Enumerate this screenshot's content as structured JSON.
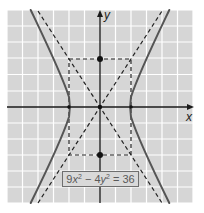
{
  "figure": {
    "type": "hyperbola-graph",
    "equation": {
      "coef_x": "9",
      "var_x": "x",
      "exp_x": "2",
      "minus": " − 4",
      "var_y": "y",
      "exp_y": "2",
      "rhs": " = 36",
      "full_text": "9x² − 4y² = 36"
    },
    "axes": {
      "x_label": "x",
      "y_label": "y"
    },
    "grid": {
      "x_range": [
        -6,
        6
      ],
      "y_range": [
        -6,
        6
      ],
      "step": 1
    },
    "key_points": {
      "vertices": [
        [
          -2,
          0
        ],
        [
          2,
          0
        ]
      ],
      "co_vertices": [
        [
          0,
          3
        ],
        [
          0,
          -3
        ]
      ],
      "center": [
        0,
        0
      ]
    },
    "fundamental_rectangle": {
      "x": [
        -2,
        2
      ],
      "y": [
        -3,
        3
      ]
    },
    "asymptotes": [
      "y = 1.5x",
      "y = -1.5x"
    ],
    "colors": {
      "background": "#d6d6d6",
      "grid": "#ffffff",
      "axis": "#1a1a1a",
      "curve": "#555555",
      "dashed": "#222222"
    }
  }
}
